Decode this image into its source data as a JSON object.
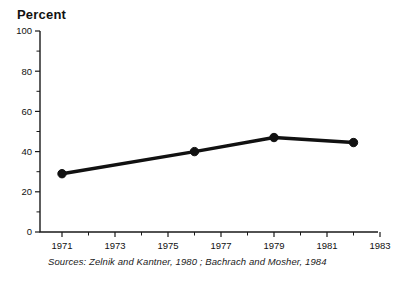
{
  "chart_data": {
    "type": "line",
    "title": "",
    "ylabel": "Percent",
    "xlabel": "",
    "x": [
      1971,
      1976,
      1979,
      1982
    ],
    "values": [
      29,
      40,
      47,
      44.5
    ],
    "series": [
      {
        "name": "Percent",
        "x": [
          1971,
          1976,
          1979,
          1982
        ],
        "values": [
          29,
          40,
          47,
          44.5
        ]
      }
    ],
    "ylim": [
      0,
      100
    ],
    "xlim": [
      1970,
      1984
    ],
    "ytick_labels": [
      "0",
      "20",
      "40",
      "60",
      "80",
      "100"
    ],
    "ytick_values": [
      0,
      20,
      40,
      60,
      80,
      100
    ],
    "yminor_values": [
      10,
      30,
      50,
      70,
      90
    ],
    "xtick_labels": [
      "1971",
      "1973",
      "1975",
      "1977",
      "1979",
      "1981",
      "1983"
    ],
    "xtick_values": [
      1971,
      1973,
      1975,
      1977,
      1979,
      1981,
      1983
    ],
    "xminor_values": [
      1972,
      1974,
      1976,
      1978,
      1980,
      1982
    ],
    "grid": false,
    "legend": "none",
    "marker": "filled-circle",
    "line_color": "#111111",
    "marker_color": "#111111",
    "axis_color": "#1a1a1a",
    "background": "#ffffff"
  },
  "labels": {
    "y_axis_title": "Percent",
    "source_note": "Sources: Zelnik and Kantner, 1980 ; Bachrach and Mosher, 1984"
  }
}
